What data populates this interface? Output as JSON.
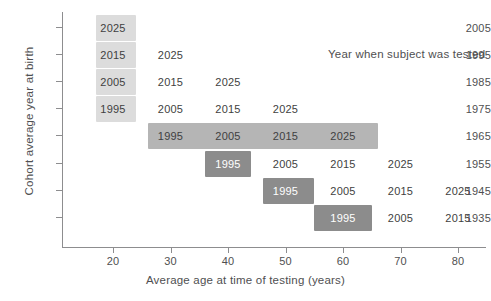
{
  "chart_data": {
    "type": "table",
    "title": "",
    "xlabel": "Average age at time of testing (years)",
    "ylabel": "Cohort average year at birth",
    "annotation": "Year when subject was tested",
    "xlim": [
      13.5,
      85
    ],
    "xticks": [
      20,
      30,
      40,
      50,
      60,
      70,
      80
    ],
    "xtick_labels": [
      "20",
      "30",
      "40",
      "50",
      "60",
      "70",
      "80"
    ],
    "yticks": [
      2005,
      1995,
      1985,
      1975,
      1965,
      1955,
      1945,
      1935
    ],
    "ytick_labels": [
      "2005",
      "1995",
      "1985",
      "1975",
      "1965",
      "1955",
      "1945",
      "1935"
    ],
    "grid": false,
    "legend": "none",
    "cell_value_meaning": "Year when subject was tested",
    "rows": [
      {
        "birth_year": 2005,
        "cells": [
          {
            "age": 20,
            "year_tested": "2025",
            "highlighted": true,
            "shade": "light"
          }
        ]
      },
      {
        "birth_year": 1995,
        "cells": [
          {
            "age": 20,
            "year_tested": "2015",
            "highlighted": true,
            "shade": "light"
          },
          {
            "age": 30,
            "year_tested": "2025",
            "highlighted": false,
            "shade": "none"
          }
        ]
      },
      {
        "birth_year": 1985,
        "cells": [
          {
            "age": 20,
            "year_tested": "2005",
            "highlighted": true,
            "shade": "light"
          },
          {
            "age": 30,
            "year_tested": "2015",
            "highlighted": false,
            "shade": "none"
          },
          {
            "age": 40,
            "year_tested": "2025",
            "highlighted": false,
            "shade": "none"
          }
        ]
      },
      {
        "birth_year": 1975,
        "cells": [
          {
            "age": 20,
            "year_tested": "1995",
            "highlighted": true,
            "shade": "light"
          },
          {
            "age": 30,
            "year_tested": "2005",
            "highlighted": false,
            "shade": "none"
          },
          {
            "age": 40,
            "year_tested": "2015",
            "highlighted": false,
            "shade": "none"
          },
          {
            "age": 50,
            "year_tested": "2025",
            "highlighted": false,
            "shade": "none"
          }
        ]
      },
      {
        "birth_year": 1965,
        "cells": [
          {
            "age": 30,
            "year_tested": "1995",
            "highlighted": true,
            "shade": "medium"
          },
          {
            "age": 40,
            "year_tested": "2005",
            "highlighted": true,
            "shade": "medium"
          },
          {
            "age": 50,
            "year_tested": "2015",
            "highlighted": true,
            "shade": "medium"
          },
          {
            "age": 60,
            "year_tested": "2025",
            "highlighted": true,
            "shade": "medium"
          }
        ]
      },
      {
        "birth_year": 1955,
        "cells": [
          {
            "age": 40,
            "year_tested": "1995",
            "highlighted": true,
            "shade": "dark"
          },
          {
            "age": 50,
            "year_tested": "2005",
            "highlighted": false,
            "shade": "none"
          },
          {
            "age": 60,
            "year_tested": "2015",
            "highlighted": false,
            "shade": "none"
          },
          {
            "age": 70,
            "year_tested": "2025",
            "highlighted": false,
            "shade": "none"
          }
        ]
      },
      {
        "birth_year": 1945,
        "cells": [
          {
            "age": 50,
            "year_tested": "1995",
            "highlighted": true,
            "shade": "dark"
          },
          {
            "age": 60,
            "year_tested": "2005",
            "highlighted": false,
            "shade": "none"
          },
          {
            "age": 70,
            "year_tested": "2015",
            "highlighted": false,
            "shade": "none"
          },
          {
            "age": 80,
            "year_tested": "2025",
            "highlighted": false,
            "shade": "none"
          }
        ]
      },
      {
        "birth_year": 1935,
        "cells": [
          {
            "age": 60,
            "year_tested": "1995",
            "highlighted": true,
            "shade": "dark"
          },
          {
            "age": 70,
            "year_tested": "2005",
            "highlighted": false,
            "shade": "none"
          },
          {
            "age": 80,
            "year_tested": "2015",
            "highlighted": false,
            "shade": "none"
          }
        ]
      }
    ],
    "bands": [
      {
        "birth_year": 2005,
        "age_start": 17,
        "age_end": 24,
        "shade": "light"
      },
      {
        "birth_year": 1995,
        "age_start": 17,
        "age_end": 24,
        "shade": "light"
      },
      {
        "birth_year": 1985,
        "age_start": 17,
        "age_end": 24,
        "shade": "light"
      },
      {
        "birth_year": 1975,
        "age_start": 17,
        "age_end": 24,
        "shade": "light"
      },
      {
        "birth_year": 1965,
        "age_start": 26,
        "age_end": 66,
        "shade": "medium"
      },
      {
        "birth_year": 1955,
        "age_start": 36,
        "age_end": 44,
        "shade": "dark"
      },
      {
        "birth_year": 1945,
        "age_start": 46,
        "age_end": 55,
        "shade": "dark"
      },
      {
        "birth_year": 1935,
        "age_start": 55,
        "age_end": 65,
        "shade": "dark"
      }
    ],
    "colors": {
      "light": "#dcdcdc",
      "medium": "#b5b5b5",
      "dark": "#8c8c8c",
      "axis": "#8d8d8f",
      "text": "#4f4f51",
      "background": "#ffffff"
    }
  }
}
